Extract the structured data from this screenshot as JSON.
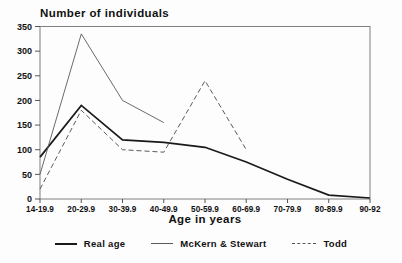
{
  "chart_data": {
    "type": "line",
    "title": "Number of individuals",
    "xlabel": "Age in years",
    "ylabel": "",
    "ylim": [
      0,
      350
    ],
    "ytick_step": 50,
    "grid": false,
    "legend_position": "bottom",
    "categories": [
      "14-19.9",
      "20-29.9",
      "30-39.9",
      "40-49.9",
      "50-59.9",
      "60-69.9",
      "70-79.9",
      "80-89.9",
      "90-92"
    ],
    "series": [
      {
        "name": "Real age",
        "style": "solid-thick",
        "color": "#1a1a1a",
        "values": [
          85,
          190,
          120,
          115,
          105,
          75,
          40,
          8,
          2
        ]
      },
      {
        "name": "McKern & Stewart",
        "style": "solid-thin",
        "color": "#5a5a5a",
        "values": [
          50,
          335,
          200,
          155,
          null,
          null,
          null,
          null,
          null
        ]
      },
      {
        "name": "Todd",
        "style": "dashed",
        "color": "#5a5a5a",
        "values": [
          20,
          180,
          100,
          95,
          240,
          100,
          null,
          null,
          null
        ]
      }
    ],
    "colors": {
      "axis": "#808080",
      "tick": "#555555",
      "text": "#111111"
    }
  }
}
